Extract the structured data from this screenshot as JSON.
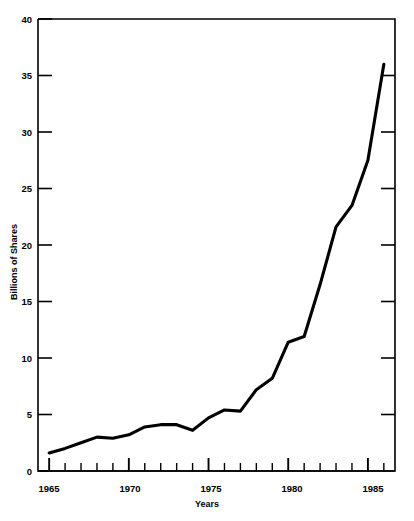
{
  "chart_data": {
    "type": "line",
    "title": "",
    "xlabel": "Years",
    "ylabel": "Billions of Shares",
    "xlim": [
      1964.3,
      1986.7
    ],
    "ylim": [
      0,
      40
    ],
    "grid": false,
    "legend": "none",
    "y_ticks": [
      0,
      5,
      10,
      15,
      20,
      25,
      30,
      35,
      40
    ],
    "y_tick_labels": [
      "0",
      "5",
      "10",
      "15",
      "20",
      "25",
      "30",
      "35",
      "40"
    ],
    "x_ticks": [
      1965,
      1966,
      1967,
      1968,
      1969,
      1970,
      1971,
      1972,
      1973,
      1974,
      1975,
      1976,
      1977,
      1978,
      1979,
      1980,
      1981,
      1982,
      1983,
      1984,
      1985,
      1986
    ],
    "x_major_ticks": [
      1965,
      1970,
      1975,
      1980,
      1985
    ],
    "x_major_tick_labels": [
      "1965",
      "1970",
      "1975",
      "1980",
      "1985"
    ],
    "x": [
      1965,
      1966,
      1967,
      1968,
      1969,
      1970,
      1971,
      1972,
      1973,
      1974,
      1975,
      1976,
      1977,
      1978,
      1979,
      1980,
      1981,
      1982,
      1983,
      1984,
      1985,
      1986
    ],
    "values": [
      1.6,
      2.0,
      2.5,
      3.0,
      2.9,
      3.2,
      3.9,
      4.1,
      4.1,
      3.6,
      4.7,
      5.4,
      5.3,
      7.2,
      8.2,
      11.4,
      11.9,
      16.5,
      21.6,
      23.5,
      27.5,
      36.0
    ],
    "series": [
      {
        "name": "Volume of shares traded",
        "color": "#000000",
        "values": [
          1.6,
          2.0,
          2.5,
          3.0,
          2.9,
          3.2,
          3.9,
          4.1,
          4.1,
          3.6,
          4.7,
          5.4,
          5.3,
          7.2,
          8.2,
          11.4,
          11.9,
          16.5,
          21.6,
          23.5,
          27.5,
          36.0
        ]
      }
    ]
  },
  "axes": {
    "y_title": "Billions of Shares",
    "x_title": "Years"
  },
  "header": {
    "ghost_caption": ""
  }
}
